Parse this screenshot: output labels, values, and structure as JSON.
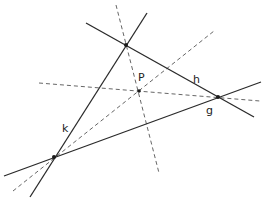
{
  "diagram": {
    "lines": {
      "g": {
        "label": "g",
        "style": "solid",
        "from": [
          4,
          176
        ],
        "to": [
          261,
          82
        ],
        "label_pos": [
          206,
          114
        ]
      },
      "h": {
        "label": "h",
        "style": "solid",
        "from": [
          86,
          23
        ],
        "to": [
          254,
          117
        ],
        "label_pos": [
          193,
          83
        ]
      },
      "k": {
        "label": "k",
        "style": "solid",
        "from": [
          30,
          197
        ],
        "to": [
          147,
          13
        ],
        "label_pos": [
          62,
          132
        ]
      }
    },
    "dashed_lines": [
      {
        "name": "bisector-top",
        "from": [
          116,
          5
        ],
        "to": [
          159,
          173
        ]
      },
      {
        "name": "bisector-right",
        "from": [
          39,
          83
        ],
        "to": [
          260,
          101
        ]
      },
      {
        "name": "bisector-left",
        "from": [
          13,
          191
        ],
        "to": [
          214,
          31
        ]
      }
    ],
    "vertices": [
      {
        "name": "top",
        "pos": [
          126,
          45
        ]
      },
      {
        "name": "right",
        "pos": [
          218,
          97
        ]
      },
      {
        "name": "bottom-left",
        "pos": [
          54,
          157
        ]
      }
    ],
    "point_P": {
      "label": "P",
      "pos": [
        139,
        91
      ],
      "label_pos": [
        138,
        81
      ]
    }
  }
}
